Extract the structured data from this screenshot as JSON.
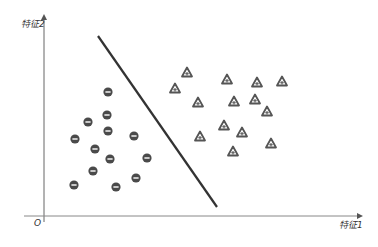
{
  "diagram": {
    "y_axis_label": "特征2",
    "x_axis_label": "特征1",
    "origin_label": "O",
    "colors": {
      "axis": "#555555",
      "boundary": "#333333",
      "negative_fill": "#4a4a4a",
      "positive_stroke": "#555555"
    },
    "decision_boundary": {
      "x1": 98,
      "y1": 36,
      "x2": 217,
      "y2": 207
    },
    "negative_class": {
      "symbol": "minus-circle",
      "points": [
        [
          108,
          92
        ],
        [
          107,
          115
        ],
        [
          88,
          122
        ],
        [
          108,
          131
        ],
        [
          75,
          139
        ],
        [
          134,
          136
        ],
        [
          95,
          149
        ],
        [
          110,
          159
        ],
        [
          147,
          158
        ],
        [
          93,
          171
        ],
        [
          136,
          178
        ],
        [
          74,
          185
        ],
        [
          116,
          187
        ]
      ]
    },
    "positive_class": {
      "symbol": "plus-triangle",
      "points": [
        [
          187,
          73
        ],
        [
          175,
          89
        ],
        [
          227,
          80
        ],
        [
          257,
          83
        ],
        [
          282,
          82
        ],
        [
          198,
          103
        ],
        [
          234,
          102
        ],
        [
          255,
          100
        ],
        [
          267,
          112
        ],
        [
          224,
          126
        ],
        [
          242,
          133
        ],
        [
          200,
          137
        ],
        [
          271,
          144
        ],
        [
          233,
          152
        ]
      ]
    }
  }
}
